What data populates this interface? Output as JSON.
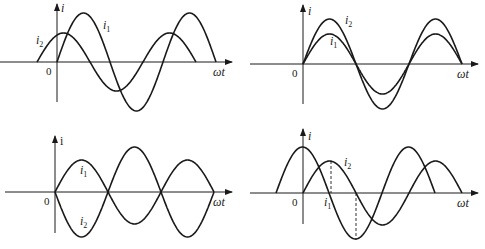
{
  "chart_data": [
    {
      "type": "line",
      "panel": "top-left",
      "title": "",
      "xlabel": "ωt",
      "ylabel": "i",
      "origin_label": "0",
      "series": [
        {
          "name": "i1",
          "label": "i",
          "sub": "1",
          "amplitude": 49,
          "phase": "in phase with origin (starts at 0)"
        },
        {
          "name": "i2",
          "label": "i",
          "sub": "2",
          "amplitude": 29,
          "phase": "leads i1"
        }
      ]
    },
    {
      "type": "line",
      "panel": "top-right",
      "xlabel": "ωt",
      "ylabel": "i",
      "origin_label": "0",
      "series": [
        {
          "name": "i1",
          "label": "i",
          "sub": "1",
          "amplitude": 30,
          "phase": "in phase"
        },
        {
          "name": "i2",
          "label": "i",
          "sub": "2",
          "amplitude": 45,
          "phase": "in phase"
        }
      ]
    },
    {
      "type": "line",
      "panel": "bottom-left",
      "xlabel": "ωt",
      "ylabel": "i",
      "origin_label": "0",
      "series": [
        {
          "name": "i1",
          "label": "i",
          "sub": "1",
          "amplitude": 32,
          "phase": "0"
        },
        {
          "name": "i2",
          "label": "i",
          "sub": "2",
          "amplitude": 45,
          "phase": "opposite (180°)"
        }
      ]
    },
    {
      "type": "line",
      "panel": "bottom-right",
      "xlabel": "ωt",
      "ylabel": "i",
      "origin_label": "0",
      "series": [
        {
          "name": "i1",
          "label": "i",
          "sub": "1",
          "amplitude": 46,
          "phase": "leads i2 by 90°"
        },
        {
          "name": "i2",
          "label": "i",
          "sub": "2",
          "amplitude": 32,
          "phase": "0"
        }
      ],
      "annotations": [
        "dashed line at i2 peak",
        "dashed line at i1 trough"
      ]
    }
  ],
  "labels": {
    "i": "i",
    "i_upright": "i",
    "sub1": "1",
    "sub2": "2",
    "omega_t": "ωt",
    "zero": "0"
  }
}
